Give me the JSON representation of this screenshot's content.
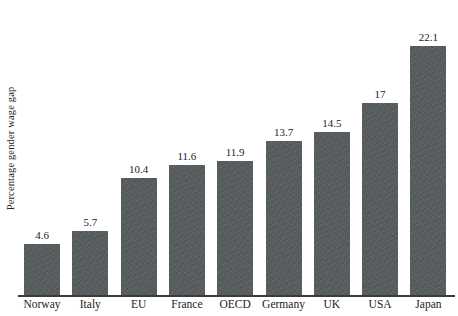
{
  "chart_data": {
    "type": "bar",
    "title": "",
    "subtitle": "",
    "xlabel": "",
    "ylabel": "Percentage gender wage gap",
    "categories": [
      "Norway",
      "Italy",
      "EU",
      "France",
      "OECD",
      "Germany",
      "UK",
      "USA",
      "Japan"
    ],
    "values": [
      4.6,
      5.7,
      10.4,
      11.6,
      11.9,
      13.7,
      14.5,
      17,
      22.1
    ],
    "value_labels": [
      "4.6",
      "5.7",
      "10.4",
      "11.6",
      "11.9",
      "13.7",
      "14.5",
      "17",
      "22.1"
    ],
    "ylim": [
      0,
      24
    ],
    "grid": false,
    "legend": null,
    "legend_position": "none",
    "bar_color": "#565b5d",
    "axis_color": "#3b3b3b",
    "background_color": "#ffffff",
    "text_color": "#1c1c1c",
    "annotations": []
  },
  "axes": {
    "y_title": "Percentage gender wage gap"
  },
  "bars": [
    {
      "category": "Norway",
      "value": 4.6,
      "label": "4.6"
    },
    {
      "category": "Italy",
      "value": 5.7,
      "label": "5.7"
    },
    {
      "category": "EU",
      "value": 10.4,
      "label": "10.4"
    },
    {
      "category": "France",
      "value": 11.6,
      "label": "11.6"
    },
    {
      "category": "OECD",
      "value": 11.9,
      "label": "11.9"
    },
    {
      "category": "Germany",
      "value": 13.7,
      "label": "13.7"
    },
    {
      "category": "UK",
      "value": 14.5,
      "label": "14.5"
    },
    {
      "category": "USA",
      "value": 17,
      "label": "17"
    },
    {
      "category": "Japan",
      "value": 22.1,
      "label": "22.1"
    }
  ]
}
